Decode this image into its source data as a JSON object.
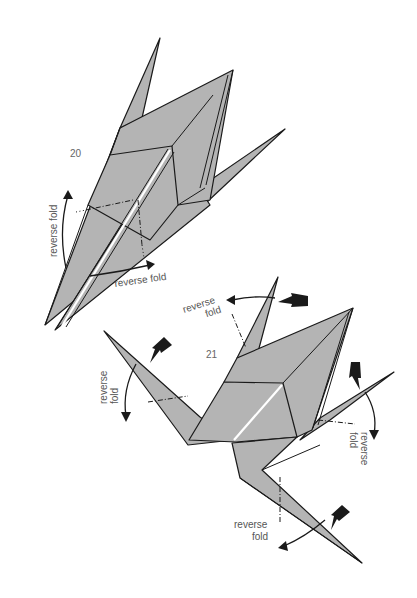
{
  "diagram": {
    "type": "origami-instructions",
    "colors": {
      "paper": "#b4b4b4",
      "line": "#1a1a1a",
      "label": "#555555",
      "background": "#ffffff"
    },
    "steps": [
      {
        "number": "20",
        "labels": [
          {
            "text": "reverse fold",
            "orientation": "vertical"
          },
          {
            "text": "reverse fold",
            "orientation": "horizontal"
          }
        ]
      },
      {
        "number": "21",
        "labels": [
          {
            "line1": "reverse",
            "line2": "fold",
            "position": "top"
          },
          {
            "line1": "reverse",
            "line2": "fold",
            "position": "left"
          },
          {
            "line1": "reverse",
            "line2": "fold",
            "position": "right"
          },
          {
            "line1": "reverse",
            "line2": "fold",
            "position": "bottom"
          }
        ]
      }
    ]
  }
}
